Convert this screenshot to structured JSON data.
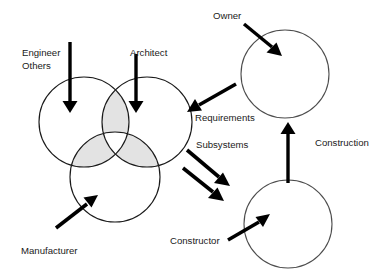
{
  "diagram": {
    "type": "venn-and-flow-diagram",
    "background_color": "#ffffff",
    "stroke_color": "#1a1a1a",
    "shade_color": "#e3e3e3",
    "labels": {
      "engineer": "Engineer",
      "others": "Others",
      "architect": "Architect",
      "manufacturer": "Manufacturer",
      "owner": "Owner",
      "requirements": "Requirements",
      "subsystems": "Subsystems",
      "construction": "Construction",
      "constructor": "Constructor"
    },
    "venn": {
      "name": "design-team-venn",
      "circles": [
        {
          "name": "engineer-others-circle",
          "cx": 84,
          "cy": 122,
          "r": 45
        },
        {
          "name": "architect-circle",
          "cx": 147,
          "cy": 122,
          "r": 45
        },
        {
          "name": "manufacturer-circle",
          "cx": 115,
          "cy": 177,
          "r": 45
        }
      ],
      "shaded_regions": [
        "engineer-architect-lens",
        "engineer-manufacturer-lens",
        "architect-manufacturer-lens"
      ],
      "center_region_shaded": false
    },
    "role_circles": [
      {
        "name": "owner-circle",
        "cx": 285,
        "cy": 74,
        "r": 44
      },
      {
        "name": "constructor-circle",
        "cx": 288,
        "cy": 224,
        "r": 44
      }
    ],
    "arrows": [
      {
        "name": "engineer-others-arrow",
        "from": "Engineer / Others label",
        "to": "engineer-others-circle",
        "direction": "down"
      },
      {
        "name": "architect-arrow",
        "from": "Architect label",
        "to": "architect-circle",
        "direction": "down"
      },
      {
        "name": "manufacturer-arrow",
        "from": "Manufacturer label",
        "to": "manufacturer-circle",
        "direction": "up-right"
      },
      {
        "name": "owner-arrow",
        "from": "Owner label",
        "to": "owner-circle",
        "direction": "down-right"
      },
      {
        "name": "requirements-arrow",
        "from": "owner-circle",
        "to": "design-team-venn",
        "direction": "down-left"
      },
      {
        "name": "subsystems-arrow-upper",
        "from": "design-team-venn",
        "to": "constructor-circle",
        "direction": "down-right"
      },
      {
        "name": "subsystems-arrow-lower",
        "from": "design-team-venn",
        "to": "constructor-circle",
        "direction": "down-right"
      },
      {
        "name": "construction-arrow",
        "from": "constructor-circle",
        "to": "owner-circle",
        "direction": "up"
      },
      {
        "name": "constructor-arrow",
        "from": "Constructor label",
        "to": "constructor-circle",
        "direction": "up-right"
      }
    ]
  }
}
